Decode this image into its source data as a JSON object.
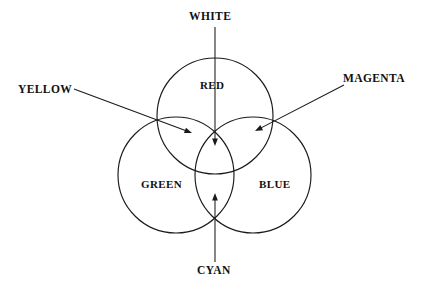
{
  "diagram": {
    "type": "venn-3-circle",
    "background_color": "#ffffff",
    "stroke_color": "#1a1a1a",
    "text_color": "#111111",
    "inner_labels": [
      {
        "id": "red",
        "text": "RED",
        "region": "top circle"
      },
      {
        "id": "green",
        "text": "GREEN",
        "region": "lower-left circle"
      },
      {
        "id": "blue",
        "text": "BLUE",
        "region": "lower-right circle"
      }
    ],
    "outer_labels": [
      {
        "id": "white",
        "text": "WHITE",
        "points_to": "center triple overlap"
      },
      {
        "id": "yellow",
        "text": "YELLOW",
        "points_to": "red and green overlap"
      },
      {
        "id": "magenta",
        "text": "MAGENTA",
        "points_to": "red and blue overlap"
      },
      {
        "id": "cyan",
        "text": "CYAN",
        "points_to": "green and blue overlap"
      }
    ],
    "circles": [
      {
        "id": "red",
        "cx": 215,
        "cy": 116,
        "r": 58
      },
      {
        "id": "green",
        "cx": 176,
        "cy": 175,
        "r": 58
      },
      {
        "id": "blue",
        "cx": 253,
        "cy": 175,
        "r": 58
      }
    ],
    "pointers": [
      {
        "id": "white",
        "from": [
          215,
          27
        ],
        "to": [
          215,
          146
        ]
      },
      {
        "id": "yellow",
        "from": [
          74,
          89
        ],
        "to": [
          192,
          133
        ]
      },
      {
        "id": "magenta",
        "from": [
          344,
          85
        ],
        "to": [
          255,
          131
        ]
      },
      {
        "id": "cyan",
        "from": [
          215,
          262
        ],
        "to": [
          215,
          193
        ]
      }
    ]
  }
}
